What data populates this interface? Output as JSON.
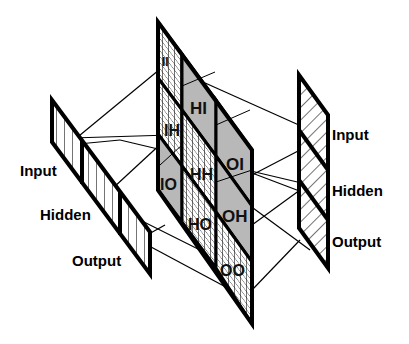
{
  "diagram": {
    "colors": {
      "stroke": "#000000",
      "shaded_block": "#b8b8b8",
      "background": "#ffffff"
    },
    "left_vector": {
      "labels": [
        "Input",
        "Hidden",
        "Output"
      ]
    },
    "right_vector": {
      "labels": [
        "Input",
        "Hidden",
        "Output"
      ]
    },
    "matrix": {
      "blocks": [
        {
          "label": "II",
          "style": "grid"
        },
        {
          "label": "HI",
          "style": "shaded"
        },
        {
          "label": "OI",
          "style": "shaded"
        },
        {
          "label": "IH",
          "style": "grid"
        },
        {
          "label": "HH",
          "style": "grid"
        },
        {
          "label": "OH",
          "style": "shaded"
        },
        {
          "label": "IO",
          "style": "shaded"
        },
        {
          "label": "HO",
          "style": "grid"
        },
        {
          "label": "OO",
          "style": "grid"
        }
      ]
    }
  }
}
